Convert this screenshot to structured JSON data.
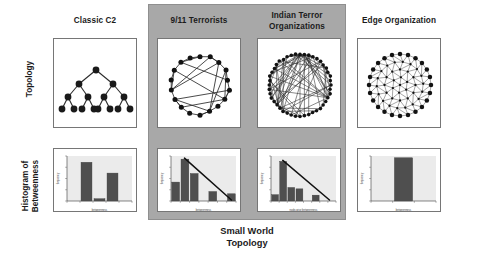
{
  "figure": {
    "background_color": "#ffffff",
    "panel_color": "#a8a8a8",
    "bar_color": "#4f4f4f",
    "plot_bg_color": "#ebebeb",
    "node_color": "#1a1a1a",
    "edge_color": "#303030"
  },
  "group": {
    "caption": "Small World\nTopology"
  },
  "rows": [
    {
      "label": "Topology"
    },
    {
      "label": "Histogram of\nBetweenness"
    }
  ],
  "columns": [
    {
      "id": "classic-c2",
      "title": "Classic C2",
      "in_group": false
    },
    {
      "id": "nine-eleven",
      "title": "9/11 Terrorists",
      "in_group": true
    },
    {
      "id": "indian-terror",
      "title": "Indian Terror\nOrganizations",
      "in_group": true
    },
    {
      "id": "edge-organization",
      "title": "Edge Organization",
      "in_group": false
    }
  ],
  "topologies": [
    {
      "id": "classic-c2",
      "type": "tree",
      "description": "Hierarchical binary command tree",
      "levels": 4,
      "node_count": 15,
      "edge_count": 14
    },
    {
      "id": "nine-eleven",
      "type": "circular-graph",
      "description": "Circular layout scale-free network with hub chords",
      "node_count": 18,
      "edge_count": 34
    },
    {
      "id": "indian-terror",
      "type": "circular-graph",
      "description": "Dense circular layout network",
      "node_count": 44,
      "edge_count": 120
    },
    {
      "id": "edge-organization",
      "type": "mesh-graph",
      "description": "Fully meshed dense peer network",
      "node_count": 60,
      "edge_count": 260
    }
  ],
  "chart_data": [
    {
      "id": "classic-c2-histogram",
      "type": "bar",
      "title": "",
      "xlabel": "betweenness",
      "ylabel": "frequency",
      "categories": [
        "0",
        "1",
        "2",
        "3",
        "4"
      ],
      "values": [
        0,
        8.6,
        0.5,
        6.2,
        0
      ],
      "ylim": [
        0,
        10
      ],
      "grid": false,
      "legend": "",
      "trendline": false
    },
    {
      "id": "nine-eleven-histogram",
      "type": "bar",
      "title": "",
      "xlabel": "betweenness",
      "ylabel": "frequency",
      "categories": [
        "0",
        "1",
        "2",
        "3",
        "4",
        "5",
        "6"
      ],
      "values": [
        4.2,
        9.3,
        6.1,
        0,
        2.1,
        0,
        1.6
      ],
      "ylim": [
        0,
        10
      ],
      "grid": false,
      "legend": "",
      "trendline": true
    },
    {
      "id": "indian-terror-histogram",
      "type": "bar",
      "title": "",
      "xlabel": "node-wise betweenness",
      "ylabel": "frequency",
      "categories": [
        "0",
        "1",
        "2",
        "3",
        "4",
        "5",
        "6",
        "7"
      ],
      "values": [
        1.4,
        8.8,
        3.0,
        2.7,
        0,
        1.3,
        0,
        0
      ],
      "ylim": [
        0,
        10
      ],
      "grid": false,
      "legend": "",
      "trendline": true
    },
    {
      "id": "edge-organization-histogram",
      "type": "bar",
      "title": "",
      "xlabel": "betweenness",
      "ylabel": "frequency",
      "categories": [
        "0",
        "1",
        "2"
      ],
      "values": [
        0,
        9.6,
        0
      ],
      "ylim": [
        0,
        10
      ],
      "grid": false,
      "legend": "",
      "trendline": false
    }
  ]
}
